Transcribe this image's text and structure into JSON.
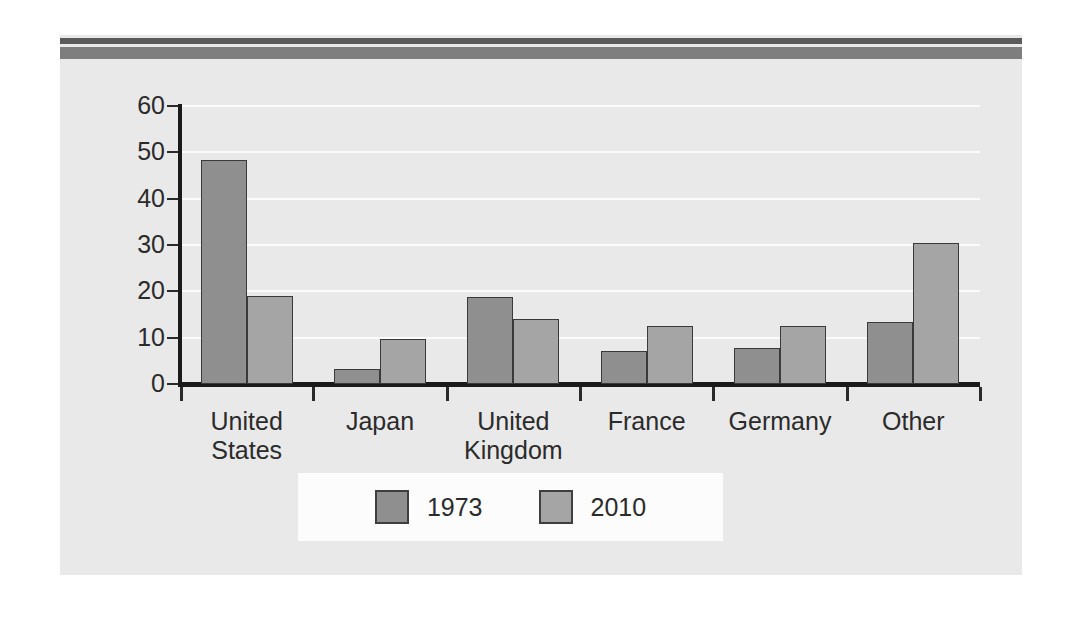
{
  "figure": {
    "background_color": "#e9e9e9",
    "rule_top_color": "#5b5b5b",
    "rule_bottom_color": "#7e7e7e"
  },
  "chart_data": {
    "type": "bar",
    "title": "",
    "subtitle": "",
    "xlabel": "",
    "ylabel": "",
    "categories": [
      "United States",
      "Japan",
      "United Kingdom",
      "France",
      "Germany",
      "Other"
    ],
    "category_lines": [
      [
        "United",
        "States"
      ],
      [
        "Japan"
      ],
      [
        "United",
        "Kingdom"
      ],
      [
        "France"
      ],
      [
        "Germany"
      ],
      [
        "Other"
      ]
    ],
    "series": [
      {
        "name": "1973",
        "color": "#8f8f8f",
        "values": [
          48.3,
          3.3,
          18.7,
          7.1,
          7.7,
          13.4
        ]
      },
      {
        "name": "2010",
        "color": "#a5a5a5",
        "values": [
          19.1,
          9.7,
          14.0,
          12.5,
          12.5,
          30.5
        ]
      }
    ],
    "ylim": [
      0,
      60
    ],
    "yticks": [
      0,
      10,
      20,
      30,
      40,
      50,
      60
    ],
    "ytick_labels": [
      "0",
      "10",
      "20",
      "30",
      "40",
      "50",
      "60"
    ],
    "grid": true,
    "gridline_color": "#fbfbfb",
    "legend_position": "bottom-center",
    "legend_background": "#fcfcfc",
    "axis_color": "#1a1a1a"
  }
}
